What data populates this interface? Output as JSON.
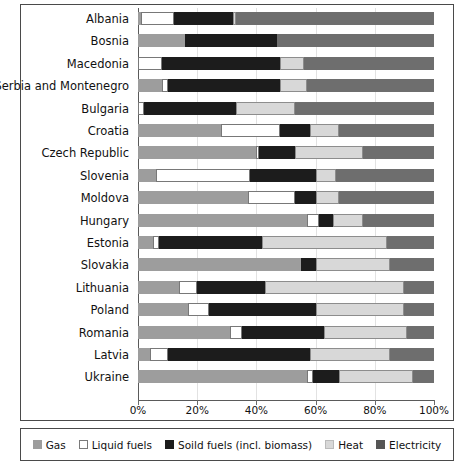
{
  "chart_data": {
    "type": "bar",
    "orientation": "horizontal",
    "stacked": true,
    "normalized": true,
    "title": "",
    "xlabel": "",
    "ylabel": "",
    "xlim": [
      0,
      100
    ],
    "grid": false,
    "legend_position": "bottom",
    "xtick_labels": [
      "0%",
      "20%",
      "40%",
      "60%",
      "80%",
      "100%"
    ],
    "xtick_values": [
      0,
      20,
      40,
      60,
      80,
      100
    ],
    "categories": [
      "Albania",
      "Bosnia",
      "Macedonia",
      "Serbia and Montenegro",
      "Bulgaria",
      "Croatia",
      "Czech Republic",
      "Slovenia",
      "Moldova",
      "Hungary",
      "Estonia",
      "Slovakia",
      "Lithuania",
      "Poland",
      "Romania",
      "Latvia",
      "Ukraine"
    ],
    "series": [
      {
        "name": "Gas",
        "key": "gas",
        "color": "#9d9d9d",
        "values": [
          1,
          16,
          0,
          8,
          0,
          28,
          40,
          6,
          37,
          57,
          5,
          55,
          14,
          17,
          31,
          4,
          57
        ]
      },
      {
        "name": "Liquid fuels",
        "key": "liquid",
        "color": "#ffffff",
        "values": [
          11,
          0,
          8,
          2,
          2,
          20,
          1,
          32,
          16,
          4,
          2,
          0,
          6,
          7,
          4,
          6,
          2
        ]
      },
      {
        "name": "Soild fuels (incl. biomass)",
        "key": "solid",
        "color": "#1c1c1c",
        "values": [
          20,
          31,
          40,
          38,
          31,
          10,
          12,
          22,
          7,
          5,
          35,
          5,
          23,
          36,
          28,
          48,
          9
        ]
      },
      {
        "name": "Heat",
        "key": "heat",
        "color": "#d8d8d8",
        "values": [
          1,
          0,
          8,
          9,
          20,
          10,
          23,
          7,
          8,
          10,
          42,
          25,
          47,
          30,
          28,
          27,
          25
        ]
      },
      {
        "name": "Electricity",
        "key": "elec",
        "color": "#6e6e6e",
        "values": [
          67,
          53,
          44,
          43,
          47,
          32,
          24,
          33,
          32,
          24,
          16,
          15,
          10,
          10,
          9,
          15,
          7
        ]
      }
    ],
    "legend": [
      {
        "label": "Gas",
        "key": "gas"
      },
      {
        "label": "Liquid fuels",
        "key": "liquid"
      },
      {
        "label": "Soild fuels (incl. biomass)",
        "key": "solid"
      },
      {
        "label": "Heat",
        "key": "heat"
      },
      {
        "label": "Electricity",
        "key": "elec"
      }
    ]
  }
}
